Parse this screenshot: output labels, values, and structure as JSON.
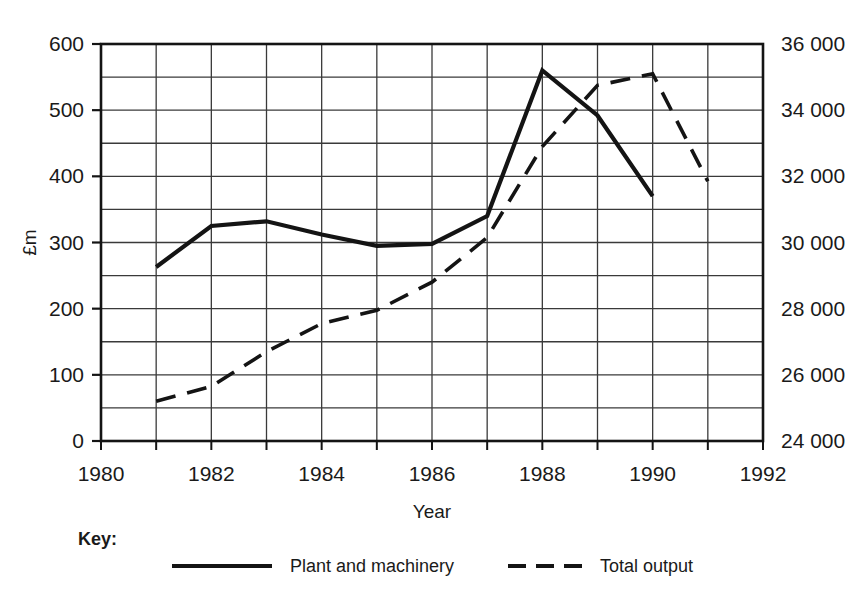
{
  "chart_data": {
    "type": "line",
    "title": "",
    "xlabel": "Year",
    "ylabel": "£m",
    "y2label": "",
    "xlim": [
      1980,
      1992
    ],
    "ylim": [
      0,
      600
    ],
    "y2lim": [
      24000,
      36000
    ],
    "grid": true,
    "legend_position": "bottom",
    "legend_title": "Key:",
    "x_ticks": [
      1980,
      1982,
      1984,
      1986,
      1988,
      1990,
      1992
    ],
    "x_tick_labels": [
      "1980",
      "1982",
      "1984",
      "1986",
      "1988",
      "1990",
      "1992"
    ],
    "x_minor_step": 1,
    "y_ticks": [
      0,
      100,
      200,
      300,
      400,
      500,
      600
    ],
    "y_tick_labels": [
      "0",
      "100",
      "200",
      "300",
      "400",
      "500",
      "600"
    ],
    "y_minor_step": 50,
    "y2_ticks": [
      24000,
      26000,
      28000,
      30000,
      32000,
      34000,
      36000
    ],
    "y2_tick_labels": [
      "24 000",
      "26 000",
      "28 000",
      "30 000",
      "32 000",
      "34 000",
      "36 000"
    ],
    "y2_minor_step": 1000,
    "series": [
      {
        "name": "Plant and machinery",
        "axis": "left",
        "style": "solid",
        "color": "#141414",
        "x": [
          1981,
          1982,
          1983,
          1984,
          1985,
          1986,
          1987,
          1988,
          1989,
          1990
        ],
        "values": [
          263,
          325,
          332,
          312,
          295,
          298,
          340,
          560,
          492,
          370
        ]
      },
      {
        "name": "Total output",
        "axis": "right",
        "style": "dashed",
        "color": "#141414",
        "x": [
          1981,
          1982,
          1983,
          1984,
          1985,
          1986,
          1987,
          1988,
          1989,
          1990,
          1991
        ],
        "values": [
          25200,
          25650,
          26700,
          27550,
          27950,
          28800,
          30150,
          32900,
          34750,
          35100,
          31850
        ]
      }
    ]
  },
  "legend": {
    "title": "Key:",
    "entries": [
      {
        "label": "Plant and machinery",
        "style": "solid"
      },
      {
        "label": "Total output",
        "style": "dashed"
      }
    ]
  },
  "axes": {
    "x_title": "Year",
    "y_title": "£m"
  }
}
